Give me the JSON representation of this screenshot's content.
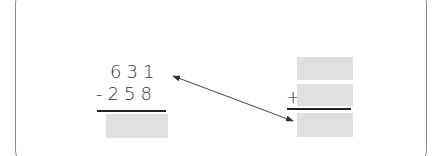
{
  "left_problem": {
    "operation": "subtraction",
    "minuend": "631",
    "subtrahend_line": "-258",
    "operator": "-",
    "subtrahend": "258",
    "answer": ""
  },
  "right_problem": {
    "operation": "addition",
    "operator": "+",
    "addend_top": "",
    "addend_bottom": "",
    "sum": ""
  },
  "connector": {
    "type": "double-headed-arrow",
    "from": "631",
    "to": "right_problem.sum"
  },
  "colors": {
    "answer_box": "#e0e0e0",
    "frame_border": "#8a8a8a",
    "text": "#333333"
  }
}
